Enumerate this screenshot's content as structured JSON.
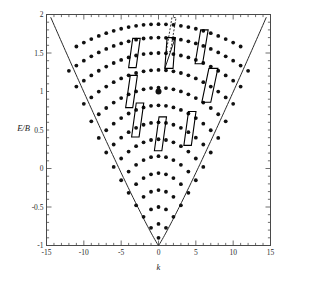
{
  "figure": {
    "background": "#ffffff",
    "frame_color": "#4a4a4a",
    "dot_color": "#111111",
    "curve_color": "#2a2a2a",
    "cell_color": "#000000"
  },
  "chart_data": {
    "type": "scatter",
    "title": "",
    "subtitle": "",
    "xlabel": "k",
    "ylabel": "E/B",
    "xlim": [
      -15,
      15
    ],
    "ylim": [
      -1,
      2
    ],
    "grid": false,
    "legend": null,
    "xticks": [
      -15,
      -10,
      -5,
      0,
      5,
      10,
      15
    ],
    "xtick_labels": [
      "-15",
      "-10",
      "-5",
      "0",
      "5",
      "10",
      "15"
    ],
    "xtick_minor_step": 1,
    "yticks": [
      -1,
      -0.5,
      0,
      0.5,
      1,
      1.5,
      2
    ],
    "ytick_labels": [
      "-1",
      "-0.5",
      "0",
      "0.5",
      "1",
      "1.5",
      "2"
    ],
    "ytick_minor_step": 0.1,
    "boundary_curve": {
      "name": "spectrum-boundary",
      "description": "V-shaped envelope through vertex (0,-1) rising to (-15,2) and (15,2)",
      "vertex": [
        0,
        -1
      ],
      "left_endpoint": [
        -14.6,
        2.0
      ],
      "right_endpoint": [
        14.6,
        2.0
      ],
      "style": "solid"
    },
    "lattice": {
      "description": "Lattice of spectral points arranged on nested arcs inside the boundary envelope",
      "rows": [
        {
          "y": 1.875,
          "k_min": -11,
          "k_max": 11,
          "k_step": 1,
          "curvature": 0.0024
        },
        {
          "y": 1.7,
          "k_min": -12,
          "k_max": 12,
          "k_step": 1,
          "curvature": 0.003
        },
        {
          "y": 1.5,
          "k_min": -11,
          "k_max": 11,
          "k_step": 1,
          "curvature": 0.0036
        },
        {
          "y": 1.28,
          "k_min": -10,
          "k_max": 10,
          "k_step": 1,
          "curvature": 0.0044
        },
        {
          "y": 1.05,
          "k_min": -9,
          "k_max": 9,
          "k_step": 1,
          "curvature": 0.0054
        },
        {
          "y": 0.82,
          "k_min": -8,
          "k_max": 8,
          "k_step": 1,
          "curvature": 0.0066
        },
        {
          "y": 0.6,
          "k_min": -7,
          "k_max": 7,
          "k_step": 1,
          "curvature": 0.008
        },
        {
          "y": 0.38,
          "k_min": -6,
          "k_max": 6,
          "k_step": 1,
          "curvature": 0.01
        },
        {
          "y": 0.16,
          "k_min": -5,
          "k_max": 5,
          "k_step": 1,
          "curvature": 0.0125
        },
        {
          "y": -0.06,
          "k_min": -4,
          "k_max": 4,
          "k_step": 1,
          "curvature": 0.016
        },
        {
          "y": -0.28,
          "k_min": -3,
          "k_max": 3,
          "k_step": 1,
          "curvature": 0.022
        },
        {
          "y": -0.5,
          "k_min": -2,
          "k_max": 2,
          "k_step": 1,
          "curvature": 0.032
        },
        {
          "y": -0.72,
          "k_min": -1,
          "k_max": 1,
          "k_step": 1,
          "curvature": 0.05
        },
        {
          "y": -0.9,
          "k_min": 0,
          "k_max": 0,
          "k_step": 1,
          "curvature": 0.0
        }
      ],
      "dot_radius_px": 1.9,
      "highlight_point": {
        "k": 0,
        "y": 1.0,
        "radius_px": 3.0,
        "label": "marked-lattice-point"
      }
    },
    "unit_cells": [
      {
        "name": "cell-left-mid",
        "k": -4.0,
        "y": 1.5,
        "w": 1.0,
        "h": 0.19,
        "shear": 0.55,
        "style": "solid"
      },
      {
        "name": "cell-center-upper",
        "k": 0.85,
        "y": 1.5,
        "w": 1.1,
        "h": 0.2,
        "shear": 0.3,
        "style": "solid"
      },
      {
        "name": "cell-center-upper-diagonal",
        "k": 0.85,
        "y": 1.5,
        "w": 1.1,
        "h": 0.2,
        "shear": 0.3,
        "style": "diagonal"
      },
      {
        "name": "cell-top-dashed",
        "k": 1.05,
        "y": 1.74,
        "w": 0.55,
        "h": 0.22,
        "shear": 0.75,
        "style": "dashed"
      },
      {
        "name": "cell-right-upper",
        "k": 4.9,
        "y": 1.58,
        "w": 1.0,
        "h": 0.22,
        "shear": 0.75,
        "style": "solid"
      },
      {
        "name": "cell-right-mid",
        "k": 5.8,
        "y": 1.08,
        "w": 1.2,
        "h": 0.22,
        "shear": 0.95,
        "style": "solid"
      },
      {
        "name": "cell-left-upper",
        "k": -4.4,
        "y": 1.0,
        "w": 0.95,
        "h": 0.21,
        "shear": 0.62,
        "style": "solid"
      },
      {
        "name": "cell-left-lower",
        "k": -3.6,
        "y": 0.63,
        "w": 1.0,
        "h": 0.22,
        "shear": 0.62,
        "style": "solid"
      },
      {
        "name": "cell-center-lower",
        "k": -0.55,
        "y": 0.45,
        "w": 1.0,
        "h": 0.22,
        "shear": 0.62,
        "style": "solid"
      },
      {
        "name": "cell-right-lower",
        "k": 3.4,
        "y": 0.52,
        "w": 1.0,
        "h": 0.22,
        "shear": 0.62,
        "style": "solid"
      }
    ]
  }
}
